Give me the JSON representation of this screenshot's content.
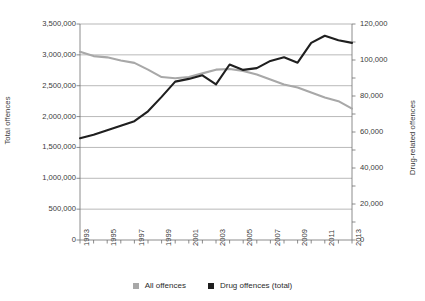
{
  "chart_data": {
    "type": "line",
    "title": "",
    "xlabel": "",
    "ylabel": "Total offences",
    "y2label": "Drug-related offences",
    "grid": true,
    "legend_position": "bottom",
    "x": [
      1993,
      1994,
      1995,
      1996,
      1997,
      1998,
      1999,
      2000,
      2001,
      2002,
      2003,
      2004,
      2005,
      2006,
      2007,
      2008,
      2009,
      2010,
      2011,
      2012,
      2013
    ],
    "x_tick_labels": [
      "1993",
      "1995",
      "1997",
      "1999",
      "2001",
      "2003",
      "2005",
      "2007",
      "2009",
      "2011",
      "2013"
    ],
    "ylim": [
      0,
      3500000
    ],
    "y_tick_labels": [
      "0",
      "500,000",
      "1,000,000",
      "1,500,000",
      "2,000,000",
      "2,500,000",
      "3,000,000",
      "3,500,000"
    ],
    "y_tick_values": [
      0,
      500000,
      1000000,
      1500000,
      2000000,
      2500000,
      3000000,
      3500000
    ],
    "y2lim": [
      0,
      120000
    ],
    "y2_tick_labels": [
      "0",
      "20,000",
      "40,000",
      "60,000",
      "80,000",
      "100,000",
      "120,000"
    ],
    "y2_tick_values": [
      0,
      20000,
      40000,
      60000,
      80000,
      100000,
      120000
    ],
    "series": [
      {
        "name": "All offences",
        "axis": "left",
        "color": "#a8a8a8",
        "values": [
          3050000,
          2980000,
          2960000,
          2910000,
          2870000,
          2760000,
          2640000,
          2620000,
          2640000,
          2700000,
          2760000,
          2770000,
          2740000,
          2680000,
          2600000,
          2520000,
          2470000,
          2390000,
          2310000,
          2250000,
          2130000
        ]
      },
      {
        "name": "Drug offences (total)",
        "axis": "right",
        "color": "#1f1f1f",
        "values": [
          56500,
          58500,
          61000,
          63500,
          66000,
          71500,
          79500,
          88000,
          89500,
          91500,
          86500,
          97500,
          94500,
          95500,
          99500,
          101500,
          98500,
          109500,
          113500,
          111000,
          109500
        ]
      }
    ]
  },
  "legend": {
    "items": [
      {
        "label": "All offences",
        "color": "#a8a8a8",
        "name": "legend-item-all-offences"
      },
      {
        "label": "Drug offences (total)",
        "color": "#1f1f1f",
        "name": "legend-item-drug-offences"
      }
    ]
  }
}
